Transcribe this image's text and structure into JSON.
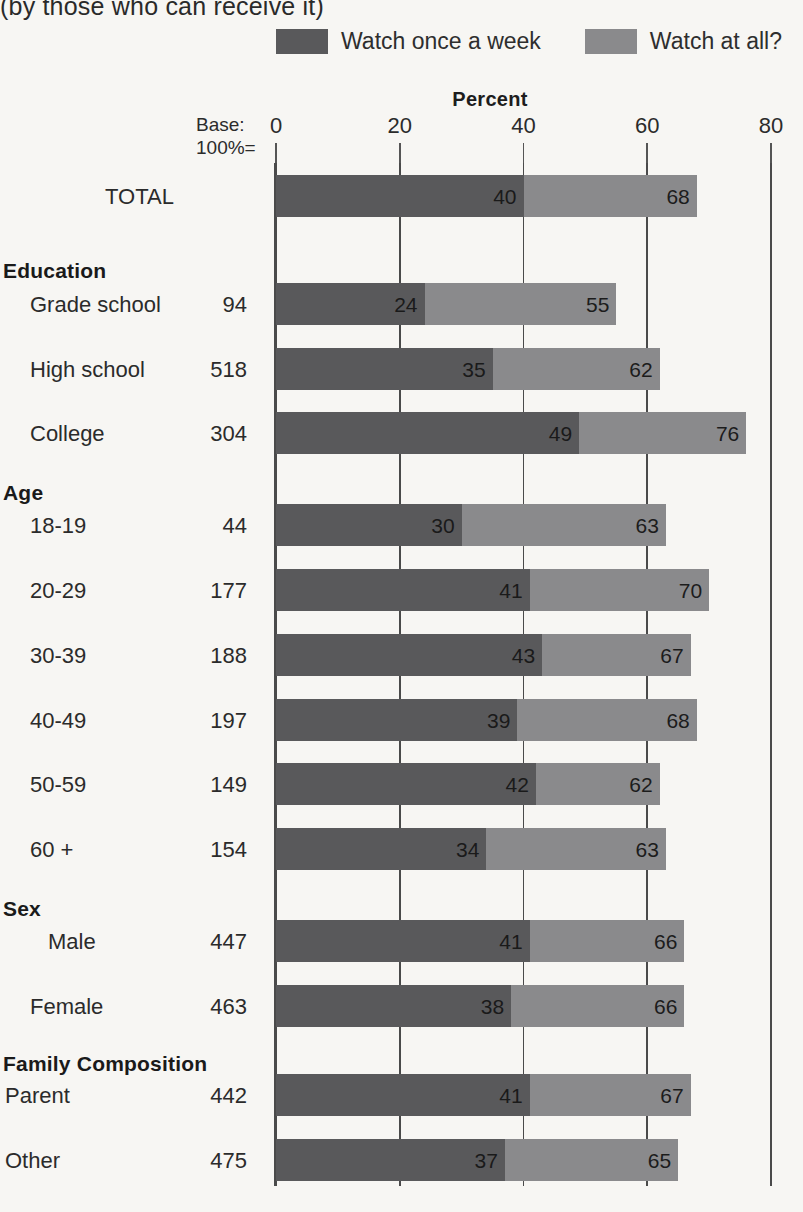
{
  "title": "(by those who can receive it)",
  "legend": {
    "position": "top-center",
    "items": [
      {
        "label": "Watch once a week",
        "color": "#59595b",
        "swatch_icon": "legend-swatch-dark"
      },
      {
        "label": "Watch at all?",
        "color": "#8a8a8c",
        "swatch_icon": "legend-swatch-light"
      }
    ]
  },
  "axis": {
    "title": "Percent",
    "base_label_line1": "Base:",
    "base_label_line2": "100%=",
    "ticks": [
      "0",
      "20",
      "40",
      "60",
      "80"
    ]
  },
  "chart_data": {
    "type": "bar",
    "orientation": "horizontal",
    "stacked": false,
    "overlapped": true,
    "title": "(by those who can receive it)",
    "xlabel": "Percent",
    "ylabel": "",
    "xlim": [
      0,
      80
    ],
    "xticks": [
      0,
      20,
      40,
      60,
      80
    ],
    "grid": true,
    "legend_position": "top-center",
    "categories": [
      "TOTAL",
      "Grade school",
      "High school",
      "College",
      "18-19",
      "20-29",
      "30-39",
      "40-49",
      "50-59",
      "60 +",
      "Male",
      "Female",
      "Parent",
      "Other"
    ],
    "group_headers": {
      "Education": [
        "Grade school",
        "High school",
        "College"
      ],
      "Age": [
        "18-19",
        "20-29",
        "30-39",
        "40-49",
        "50-59",
        "60 +"
      ],
      "Sex": [
        "Male",
        "Female"
      ],
      "Family Composition": [
        "Parent",
        "Other"
      ]
    },
    "series": [
      {
        "name": "Watch once a week",
        "color": "#59595b",
        "values": [
          40,
          24,
          35,
          49,
          30,
          41,
          43,
          39,
          42,
          34,
          41,
          38,
          41,
          37
        ]
      },
      {
        "name": "Watch at all?",
        "color": "#8a8a8c",
        "values": [
          68,
          55,
          62,
          76,
          63,
          70,
          67,
          68,
          62,
          63,
          66,
          66,
          67,
          65
        ]
      }
    ],
    "base_100_percent": [
      null,
      94,
      518,
      304,
      44,
      177,
      188,
      197,
      149,
      154,
      447,
      463,
      442,
      475
    ]
  },
  "rows": [
    {
      "kind": "bar",
      "label": "TOTAL",
      "base": "",
      "once": 40,
      "all": 68,
      "label_left": 105,
      "y": 175
    },
    {
      "kind": "header",
      "label": "Education",
      "y": 259
    },
    {
      "kind": "bar",
      "label": "Grade school",
      "base": "94",
      "once": 24,
      "all": 55,
      "label_left": 30,
      "y": 283
    },
    {
      "kind": "bar",
      "label": "High school",
      "base": "518",
      "once": 35,
      "all": 62,
      "label_left": 30,
      "y": 348
    },
    {
      "kind": "bar",
      "label": "College",
      "base": "304",
      "once": 49,
      "all": 76,
      "label_left": 30,
      "y": 412
    },
    {
      "kind": "header",
      "label": "Age",
      "y": 481
    },
    {
      "kind": "bar",
      "label": "18-19",
      "base": "44",
      "once": 30,
      "all": 63,
      "label_left": 30,
      "y": 504
    },
    {
      "kind": "bar",
      "label": "20-29",
      "base": "177",
      "once": 41,
      "all": 70,
      "label_left": 30,
      "y": 569
    },
    {
      "kind": "bar",
      "label": "30-39",
      "base": "188",
      "once": 43,
      "all": 67,
      "label_left": 30,
      "y": 634
    },
    {
      "kind": "bar",
      "label": "40-49",
      "base": "197",
      "once": 39,
      "all": 68,
      "label_left": 30,
      "y": 699
    },
    {
      "kind": "bar",
      "label": "50-59",
      "base": "149",
      "once": 42,
      "all": 62,
      "label_left": 30,
      "y": 763
    },
    {
      "kind": "bar",
      "label": "60 +",
      "base": "154",
      "once": 34,
      "all": 63,
      "label_left": 30,
      "y": 828
    },
    {
      "kind": "header",
      "label": "Sex",
      "y": 897
    },
    {
      "kind": "bar",
      "label": "Male",
      "base": "447",
      "once": 41,
      "all": 66,
      "label_left": 48,
      "y": 920
    },
    {
      "kind": "bar",
      "label": "Female",
      "base": "463",
      "once": 38,
      "all": 66,
      "label_left": 30,
      "y": 985
    },
    {
      "kind": "header",
      "label": "Family Composition",
      "y": 1052
    },
    {
      "kind": "bar",
      "label": "Parent",
      "base": "442",
      "once": 41,
      "all": 67,
      "label_left": 5,
      "y": 1074
    },
    {
      "kind": "bar",
      "label": "Other",
      "base": "475",
      "once": 37,
      "all": 65,
      "label_left": 5,
      "y": 1139
    }
  ]
}
